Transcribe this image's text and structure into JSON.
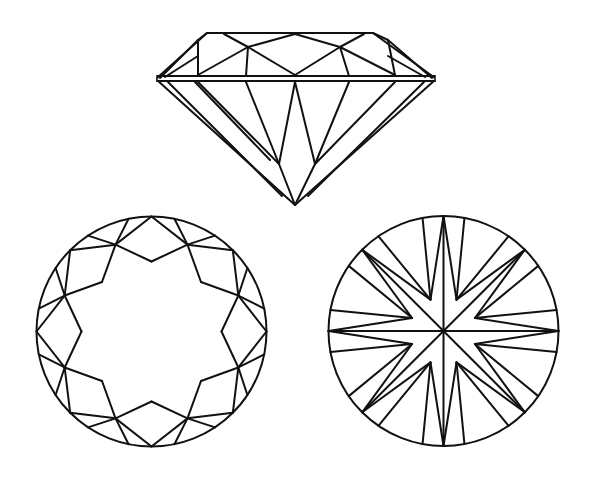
{
  "colors": {
    "line": "#111111",
    "background": "#ffffff"
  },
  "views": [
    {
      "name": "side-view",
      "label": ""
    },
    {
      "name": "crown-top-view",
      "label": ""
    },
    {
      "name": "pavilion-bottom-view",
      "label": ""
    }
  ]
}
